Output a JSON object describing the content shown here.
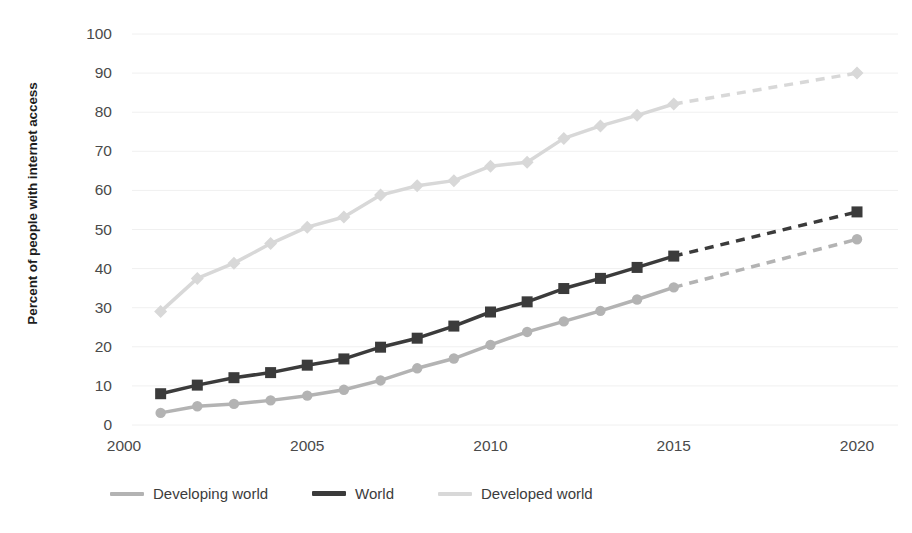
{
  "chart_data": {
    "type": "line",
    "title": "",
    "subtitle": "",
    "xlabel": "",
    "ylabel": "Percent of people with internet access",
    "xlim": [
      2000,
      2020
    ],
    "ylim": [
      0,
      100
    ],
    "ytick_step": 10,
    "grid": true,
    "grid_axis": "y",
    "legend_position": "bottom-left",
    "x_ticks": [
      "2000",
      "2005",
      "2010",
      "2015",
      "2020"
    ],
    "y_ticks": [
      "0",
      "10",
      "20",
      "30",
      "40",
      "50",
      "60",
      "70",
      "80",
      "90",
      "100"
    ],
    "x": [
      2001,
      2002,
      2003,
      2004,
      2005,
      2006,
      2007,
      2008,
      2009,
      2010,
      2011,
      2012,
      2013,
      2014,
      2015,
      2020
    ],
    "solid_until_year": 2015,
    "dashed_note": "Each series is drawn solid with markers from 2001 to 2015, then a dashed segment extrapolates to 2020 ending with a marker.",
    "series": [
      {
        "name": "Developing world",
        "color": "#b3b3b3",
        "marker": "circle",
        "line_width": 3.5,
        "values": [
          3.1,
          4.8,
          5.4,
          6.3,
          7.5,
          9.0,
          11.4,
          14.5,
          17.0,
          20.5,
          23.8,
          26.5,
          29.2,
          32.1,
          35.2,
          47.5
        ]
      },
      {
        "name": "World",
        "color": "#3b3b3b",
        "marker": "square",
        "line_width": 3.5,
        "values": [
          8.0,
          10.2,
          12.1,
          13.4,
          15.3,
          16.9,
          19.9,
          22.2,
          25.3,
          28.9,
          31.5,
          34.9,
          37.5,
          40.3,
          43.2,
          54.5
        ]
      },
      {
        "name": "Developed world",
        "color": "#d8d8d8",
        "marker": "diamond",
        "line_width": 3.5,
        "values": [
          29.0,
          37.5,
          41.4,
          46.4,
          50.6,
          53.2,
          58.8,
          61.2,
          62.5,
          66.2,
          67.2,
          73.3,
          76.5,
          79.2,
          82.1,
          90.0
        ]
      }
    ]
  },
  "legend": {
    "items": [
      {
        "label": "Developing world",
        "color": "#b3b3b3"
      },
      {
        "label": "World",
        "color": "#3b3b3b"
      },
      {
        "label": "Developed world",
        "color": "#d8d8d8"
      }
    ]
  },
  "axis": {
    "y_title": "Percent of people with internet access"
  }
}
